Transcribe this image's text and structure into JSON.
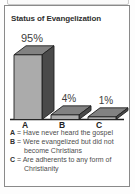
{
  "panel": {
    "title": "Status of Evangelization"
  },
  "chart_data": {
    "type": "bar",
    "variant": "3d-column",
    "title": "Status of Evangelization",
    "categories": [
      "A",
      "B",
      "C"
    ],
    "values": [
      95,
      4,
      1
    ],
    "value_labels": [
      "95%",
      "4%",
      "1%"
    ],
    "xlabel": "",
    "ylabel": "",
    "ylim": [
      0,
      100
    ],
    "grid": false,
    "legend_position": "below",
    "colors": {
      "bar_front": "#ababab",
      "bar_top": "#828282",
      "bar_side": "#4a4a4a",
      "outline": "#202020",
      "label_text": "#3d3d3d",
      "category_text": "#222222"
    }
  },
  "legend": {
    "items": [
      {
        "key": "A",
        "sep": "=",
        "text": "Have never heard the gospel"
      },
      {
        "key": "B",
        "sep": "=",
        "text": "Were evangelized but did not become Christians"
      },
      {
        "key": "C",
        "sep": "=",
        "text": "Are adherents to any form of Christianity"
      }
    ]
  }
}
